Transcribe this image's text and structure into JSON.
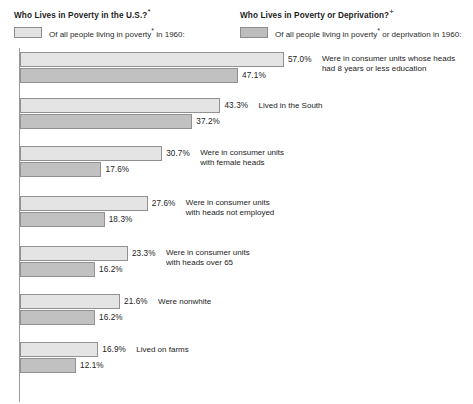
{
  "legend": {
    "left": {
      "title": "Who Lives in Poverty in the U.S.?",
      "footnote_symbol": "*",
      "subtitle_pre": "Of all people living in poverty",
      "subtitle_sup": "*",
      "subtitle_post": " in 1960:",
      "swatch_color": "#e3e3e3"
    },
    "right": {
      "title": "Who Lives in Poverty or Deprivation?",
      "footnote_symbol": "+",
      "subtitle_pre": "Of all people living in poverty",
      "subtitle_sup": "*",
      "subtitle_post": " or deprivation in 1960:",
      "swatch_color": "#bdbdbd"
    }
  },
  "chart_data": {
    "type": "bar",
    "title": "Who Lives in Poverty in the U.S.?",
    "orientation": "horizontal",
    "grouped": true,
    "xlabel": "",
    "ylabel": "",
    "xlim": [
      0,
      60
    ],
    "grid": false,
    "legend_position": "top",
    "value_suffix": "%",
    "categories": [
      "Were in consumer units whose heads\nhad 8 years or less education",
      "Lived in the South",
      "Were in consumer units\nwith female heads",
      "Were in consumer units\nwith heads not employed",
      "Were in consumer units\nwith heads over 65",
      "Were nonwhite",
      "Lived on farms"
    ],
    "series": [
      {
        "name": "Of all people living in poverty in 1960",
        "color": "#e4e4e4",
        "values": [
          57.0,
          43.3,
          30.7,
          27.6,
          23.3,
          21.6,
          16.9
        ],
        "labels": [
          "57.0%",
          "43.3%",
          "30.7%",
          "27.6%",
          "23.3%",
          "21.6%",
          "16.9%"
        ]
      },
      {
        "name": "Of all people living in poverty or deprivation in 1960",
        "color": "#c1c1c1",
        "values": [
          47.1,
          37.2,
          17.6,
          18.3,
          16.2,
          16.2,
          12.1
        ],
        "labels": [
          "47.1%",
          "37.2%",
          "17.6%",
          "18.3%",
          "16.2%",
          "16.2%",
          "12.1%"
        ]
      }
    ]
  }
}
